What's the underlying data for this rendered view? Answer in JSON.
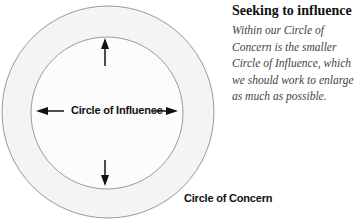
{
  "sidebar_text": {
    "title": "Seeking to influence",
    "lines": [
      "Within our Circle of",
      "Concern is the smaller",
      "Circle of Influence, which",
      "we should work to enlarge",
      "as much as possible."
    ]
  },
  "diagram": {
    "inner_circle": {
      "label": "Circle of Influence",
      "fill": "#fcfcfc",
      "stroke": "#9a9a9a"
    },
    "outer_circle": {
      "label": "Circle of Concern",
      "fill": "#f4f4f4",
      "stroke": "#9a9a9a"
    },
    "arrows": [
      "up",
      "down",
      "left",
      "right"
    ]
  }
}
